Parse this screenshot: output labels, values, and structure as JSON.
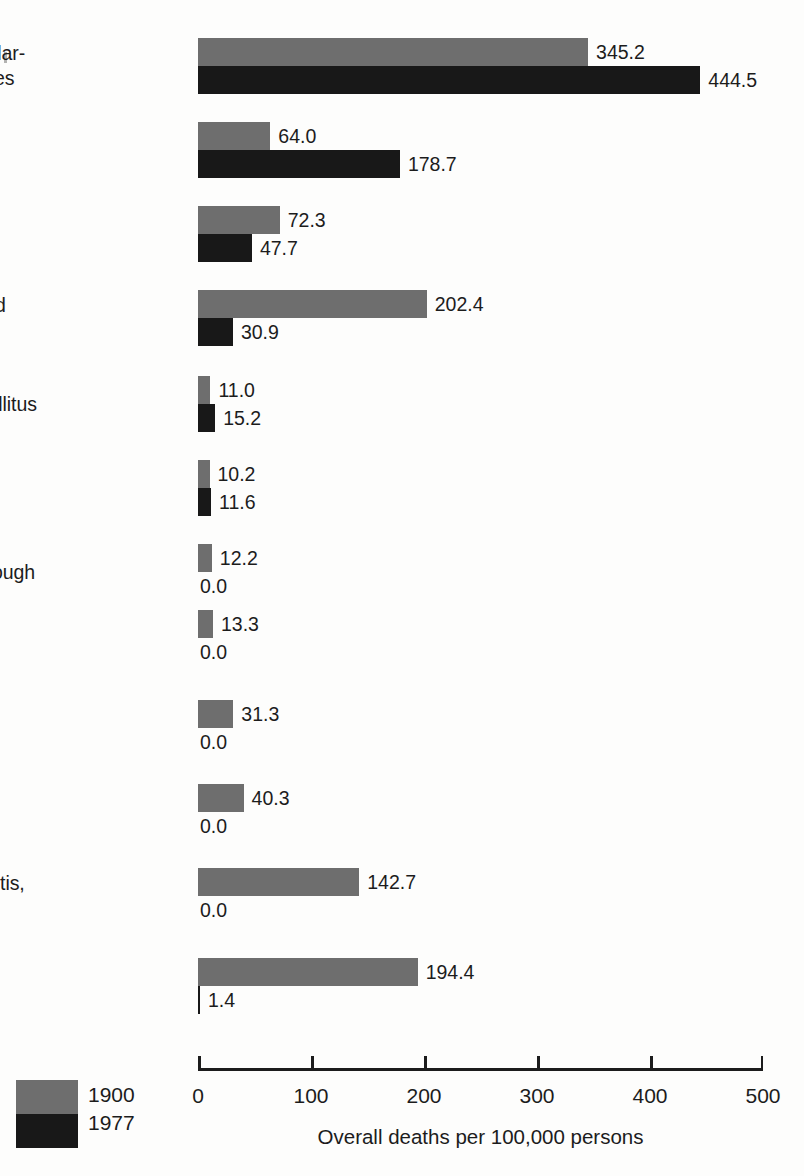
{
  "chart_data": {
    "type": "bar",
    "orientation": "horizontal",
    "title": "",
    "xlabel": "Overall deaths per 100,000 persons",
    "ylabel": "",
    "xlim": [
      0,
      500
    ],
    "xticks": [
      0,
      100,
      200,
      300,
      400,
      500
    ],
    "xtick_labels": [
      "0",
      "100",
      "200",
      "300",
      "400",
      "500"
    ],
    "grid": false,
    "legend_position": "bottom-left",
    "categories": [
      "Cardiovascular-\nrenal diseases",
      "Cancers",
      "Accidents",
      "Influenza and\npneumonia",
      "Diabetes mellitus",
      "Suicides",
      "Whooping cough",
      "Measles",
      "Typhoid and\nparatyphoid\nfevers",
      "Diphtheria",
      "Gastritis, colitis,\nand enteritis",
      "Tuberculosis"
    ],
    "series": [
      {
        "name": "1900",
        "color": "#6e6e6e",
        "values": [
          345.2,
          64.0,
          72.3,
          202.4,
          11.0,
          10.2,
          12.2,
          13.3,
          31.3,
          40.3,
          142.7,
          194.4
        ],
        "labels": [
          "345.2",
          "64.0",
          "72.3",
          "202.4",
          "11.0",
          "10.2",
          "12.2",
          "13.3",
          "31.3",
          "40.3",
          "142.7",
          "194.4"
        ]
      },
      {
        "name": "1977",
        "color": "#181818",
        "values": [
          444.5,
          178.7,
          47.7,
          30.9,
          15.2,
          11.6,
          0.0,
          0.0,
          0.0,
          0.0,
          0.0,
          1.4
        ],
        "labels": [
          "444.5",
          "178.7",
          "47.7",
          "30.9",
          "15.2",
          "11.6",
          "0.0",
          "0.0",
          "0.0",
          "0.0",
          "0.0",
          "1.4"
        ]
      }
    ]
  },
  "legend": {
    "old_label": "1900",
    "new_label": "1977"
  },
  "axis": {
    "title": "Overall deaths per 100,000 persons"
  }
}
